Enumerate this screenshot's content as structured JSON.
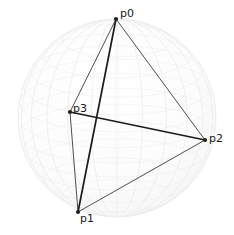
{
  "figure": {
    "type": "3d-scatter-wireframe",
    "title": "",
    "background_color": "#ffffff",
    "sphere": {
      "name": "unit-sphere",
      "center_px": [
        117,
        118
      ],
      "radius_px": 99,
      "fill_color": "#fbfbfb",
      "mesh_color": "#ededed",
      "outline_color": "#f0f0f0",
      "mesh_visible": true
    },
    "points": [
      {
        "id": "p0",
        "label": "p0",
        "x_px": 116,
        "y_px": 19,
        "label_x_px": 120,
        "label_y_px": 17,
        "marker_color": "#202020",
        "marker_size_px": 3
      },
      {
        "id": "p1",
        "label": "p1",
        "x_px": 78,
        "y_px": 212,
        "label_x_px": 80,
        "label_y_px": 222,
        "marker_color": "#202020",
        "marker_size_px": 3
      },
      {
        "id": "p2",
        "label": "p2",
        "x_px": 205,
        "y_px": 140,
        "label_x_px": 209,
        "label_y_px": 142,
        "marker_color": "#202020",
        "marker_size_px": 3
      },
      {
        "id": "p3",
        "label": "p3",
        "x_px": 70,
        "y_px": 112,
        "label_x_px": 73,
        "label_y_px": 112,
        "marker_color": "#202020",
        "marker_size_px": 3
      }
    ],
    "edges": [
      {
        "id": "e-p0-p1",
        "from": "p0",
        "to": "p1",
        "width_px": 1.7,
        "color": "#1c1c1c"
      },
      {
        "id": "e-p0-p2",
        "from": "p0",
        "to": "p2",
        "width_px": 0.9,
        "color": "#3a3a3a"
      },
      {
        "id": "e-p0-p3",
        "from": "p0",
        "to": "p3",
        "width_px": 0.9,
        "color": "#3a3a3a"
      },
      {
        "id": "e-p1-p2",
        "from": "p1",
        "to": "p2",
        "width_px": 0.9,
        "color": "#3a3a3a"
      },
      {
        "id": "e-p1-p3",
        "from": "p1",
        "to": "p3",
        "width_px": 0.9,
        "color": "#3a3a3a"
      },
      {
        "id": "e-p2-p3",
        "from": "p2",
        "to": "p3",
        "width_px": 1.7,
        "color": "#1c1c1c"
      }
    ]
  },
  "chart_data": {
    "type": "scatter",
    "title": "",
    "xlabel": "",
    "ylabel": "",
    "legend": [],
    "grid": false,
    "annotations": [
      "p0",
      "p1",
      "p2",
      "p3"
    ],
    "categories": [
      "p0",
      "p1",
      "p2",
      "p3"
    ],
    "series": [
      {
        "name": "points",
        "x": [
          116,
          78,
          205,
          70
        ],
        "y": [
          19,
          212,
          140,
          112
        ],
        "labels": [
          "p0",
          "p1",
          "p2",
          "p3"
        ]
      }
    ],
    "edges": [
      [
        "p0",
        "p1"
      ],
      [
        "p0",
        "p2"
      ],
      [
        "p0",
        "p3"
      ],
      [
        "p1",
        "p2"
      ],
      [
        "p1",
        "p3"
      ],
      [
        "p2",
        "p3"
      ]
    ],
    "xlim": [
      0,
      234
    ],
    "ylim": [
      235,
      0
    ]
  }
}
